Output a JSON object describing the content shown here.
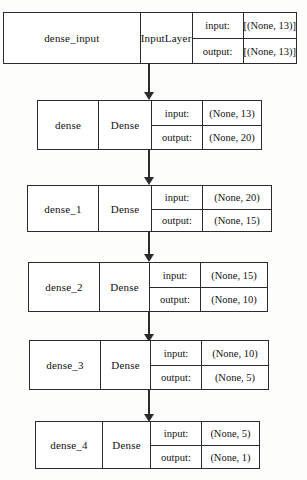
{
  "diagram": {
    "type": "neural-network-layer-graph",
    "background_color": "#fdfdfb",
    "line_color": "#2b2b2b",
    "io_labels": {
      "input": "input:",
      "output": "output:"
    },
    "nodes": [
      {
        "id": "dense_input",
        "name": "dense_input",
        "layer_type": "InputLayer",
        "input_shape": "[(None, 13)]",
        "output_shape": "[(None, 13)]"
      },
      {
        "id": "dense",
        "name": "dense",
        "layer_type": "Dense",
        "input_shape": "(None, 13)",
        "output_shape": "(None, 20)"
      },
      {
        "id": "dense_1",
        "name": "dense_1",
        "layer_type": "Dense",
        "input_shape": "(None, 20)",
        "output_shape": "(None, 15)"
      },
      {
        "id": "dense_2",
        "name": "dense_2",
        "layer_type": "Dense",
        "input_shape": "(None, 15)",
        "output_shape": "(None, 10)"
      },
      {
        "id": "dense_3",
        "name": "dense_3",
        "layer_type": "Dense",
        "input_shape": "(None, 10)",
        "output_shape": "(None, 5)"
      },
      {
        "id": "dense_4",
        "name": "dense_4",
        "layer_type": "Dense",
        "input_shape": "(None, 5)",
        "output_shape": "(None, 1)"
      }
    ],
    "edges": [
      {
        "from": "dense_input",
        "to": "dense"
      },
      {
        "from": "dense",
        "to": "dense_1"
      },
      {
        "from": "dense_1",
        "to": "dense_2"
      },
      {
        "from": "dense_2",
        "to": "dense_3"
      },
      {
        "from": "dense_3",
        "to": "dense_4"
      }
    ]
  }
}
